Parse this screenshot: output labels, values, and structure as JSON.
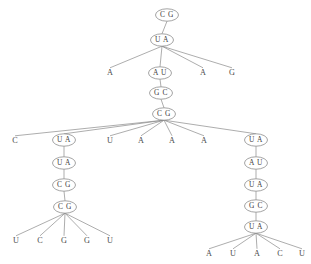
{
  "figure": {
    "kind": "rna-secondary-structure-tree",
    "background_color": "#ffffff",
    "edge_color": "#8a8a8a",
    "node_stroke_color": "#7d7d7d",
    "node_fill_color": "#ffffff",
    "text_color": "#3b3b3b"
  },
  "nodes": {
    "n1": {
      "label": "C G",
      "shape": "ellipse",
      "x": 167,
      "y": 15
    },
    "n2": {
      "label": "U A",
      "shape": "ellipse",
      "x": 162,
      "y": 40
    },
    "n3": {
      "label": "A",
      "shape": "plain",
      "x": 110,
      "y": 73
    },
    "n4": {
      "label": "A U",
      "shape": "ellipse",
      "x": 160,
      "y": 73
    },
    "n5": {
      "label": "A",
      "shape": "plain",
      "x": 203,
      "y": 73
    },
    "n6": {
      "label": "G",
      "shape": "plain",
      "x": 232,
      "y": 73
    },
    "n7": {
      "label": "G C",
      "shape": "ellipse",
      "x": 161,
      "y": 93
    },
    "n8": {
      "label": "C G",
      "shape": "ellipse",
      "x": 164,
      "y": 114
    },
    "n9": {
      "label": "C",
      "shape": "plain",
      "x": 15,
      "y": 141
    },
    "n10": {
      "label": "U A",
      "shape": "ellipse",
      "x": 64,
      "y": 140
    },
    "n11": {
      "label": "U",
      "shape": "plain",
      "x": 110,
      "y": 141
    },
    "n12": {
      "label": "A",
      "shape": "plain",
      "x": 141,
      "y": 141
    },
    "n13": {
      "label": "A",
      "shape": "plain",
      "x": 172,
      "y": 141
    },
    "n14": {
      "label": "A",
      "shape": "plain",
      "x": 204,
      "y": 141
    },
    "n15": {
      "label": "U A",
      "shape": "ellipse",
      "x": 256,
      "y": 140
    },
    "n16": {
      "label": "U A",
      "shape": "ellipse",
      "x": 64,
      "y": 163
    },
    "n17": {
      "label": "C G",
      "shape": "ellipse",
      "x": 64,
      "y": 185
    },
    "n18": {
      "label": "C G",
      "shape": "ellipse",
      "x": 65,
      "y": 207
    },
    "n19": {
      "label": "U",
      "shape": "plain",
      "x": 16,
      "y": 241
    },
    "n20": {
      "label": "C",
      "shape": "plain",
      "x": 40,
      "y": 241
    },
    "n21": {
      "label": "G",
      "shape": "plain",
      "x": 64,
      "y": 241
    },
    "n22": {
      "label": "G",
      "shape": "plain",
      "x": 87,
      "y": 241
    },
    "n23": {
      "label": "U",
      "shape": "plain",
      "x": 110,
      "y": 241
    },
    "n24": {
      "label": "A U",
      "shape": "ellipse",
      "x": 256,
      "y": 163
    },
    "n25": {
      "label": "U A",
      "shape": "ellipse",
      "x": 256,
      "y": 185
    },
    "n26": {
      "label": "G C",
      "shape": "ellipse",
      "x": 256,
      "y": 206
    },
    "n27": {
      "label": "U A",
      "shape": "ellipse",
      "x": 256,
      "y": 227
    },
    "n28": {
      "label": "A",
      "shape": "plain",
      "x": 209,
      "y": 254
    },
    "n29": {
      "label": "U",
      "shape": "plain",
      "x": 233,
      "y": 254
    },
    "n30": {
      "label": "A",
      "shape": "plain",
      "x": 257,
      "y": 254
    },
    "n31": {
      "label": "C",
      "shape": "plain",
      "x": 280,
      "y": 254
    },
    "n32": {
      "label": "U",
      "shape": "plain",
      "x": 302,
      "y": 254
    }
  },
  "edges": [
    {
      "from": "n1",
      "to": "n2"
    },
    {
      "from": "n2",
      "to": "n3"
    },
    {
      "from": "n2",
      "to": "n4"
    },
    {
      "from": "n2",
      "to": "n5"
    },
    {
      "from": "n2",
      "to": "n6"
    },
    {
      "from": "n4",
      "to": "n7"
    },
    {
      "from": "n7",
      "to": "n8"
    },
    {
      "from": "n8",
      "to": "n9"
    },
    {
      "from": "n8",
      "to": "n10"
    },
    {
      "from": "n8",
      "to": "n11"
    },
    {
      "from": "n8",
      "to": "n12"
    },
    {
      "from": "n8",
      "to": "n13"
    },
    {
      "from": "n8",
      "to": "n14"
    },
    {
      "from": "n8",
      "to": "n15"
    },
    {
      "from": "n10",
      "to": "n16"
    },
    {
      "from": "n16",
      "to": "n17"
    },
    {
      "from": "n17",
      "to": "n18"
    },
    {
      "from": "n18",
      "to": "n19"
    },
    {
      "from": "n18",
      "to": "n20"
    },
    {
      "from": "n18",
      "to": "n21"
    },
    {
      "from": "n18",
      "to": "n22"
    },
    {
      "from": "n18",
      "to": "n23"
    },
    {
      "from": "n15",
      "to": "n24"
    },
    {
      "from": "n24",
      "to": "n25"
    },
    {
      "from": "n25",
      "to": "n26"
    },
    {
      "from": "n26",
      "to": "n27"
    },
    {
      "from": "n27",
      "to": "n28"
    },
    {
      "from": "n27",
      "to": "n29"
    },
    {
      "from": "n27",
      "to": "n30"
    },
    {
      "from": "n27",
      "to": "n31"
    },
    {
      "from": "n27",
      "to": "n32"
    }
  ]
}
